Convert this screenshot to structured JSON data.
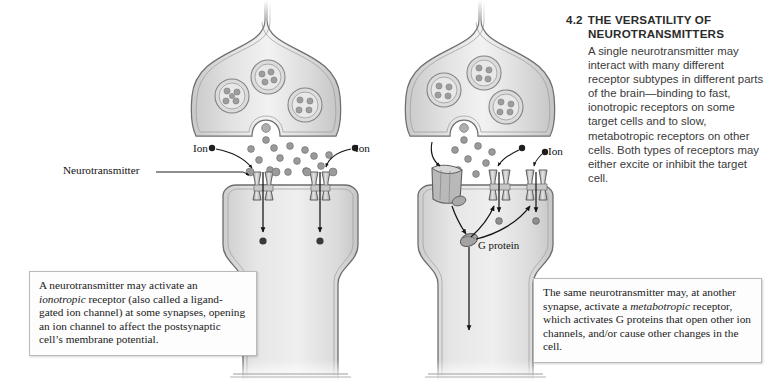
{
  "figure": {
    "number": "4.2",
    "title_line1": "THE VERSATILITY OF",
    "title_line2": "NEUROTRANSMITTERS",
    "body": "A single neurotransmitter may interact with many different receptor subtypes in different parts of the brain—binding to fast, ionotropic receptors on some target cells and to slow, metabotropic receptors on other cells. Both types of receptors may either excite or inhibit the target cell."
  },
  "captions": {
    "left": {
      "text_before": "A neurotransmitter may activate an ",
      "emphasis": "ionotropic",
      "text_after": " receptor (also called a ligand-gated ion channel) at some synapses, opening an ion channel to affect the postsynaptic cell’s membrane potential."
    },
    "right": {
      "text_before": "The same neurotransmitter may, at another synapse, activate a ",
      "emphasis": "metabotropic",
      "text_after": " receptor, which activates G proteins that open other ion channels, and/or cause other changes in the cell."
    }
  },
  "diagram": {
    "labels": {
      "neurotransmitter": "Neurotransmitter",
      "ion_left": "Ion",
      "ion_mid": "Ion",
      "ion_right": "Ion",
      "g_protein": "G protein"
    },
    "panels": [
      {
        "id": "ionotropic",
        "receptor_type": "ionotropic",
        "receptor_count": 2,
        "vesicle_count": 3,
        "transmitter_dot_count": 14
      },
      {
        "id": "metabotropic",
        "receptor_type": "metabotropic",
        "receptor_count": 1,
        "ion_channel_count": 2,
        "vesicle_count": 3,
        "transmitter_dot_count": 8,
        "g_protein_count": 1
      }
    ]
  },
  "colors": {
    "cell_fill_light": "#e7e7e7",
    "cell_fill_mid": "#d2d2d2",
    "cell_outline": "#6d6d6d",
    "dot_fill": "#8e8e8e",
    "ion_dot_fill": "#3a3a3a",
    "arrow": "#1a1a1a",
    "caption_border": "#b9b9b9",
    "title_text": "#2b2b2b",
    "body_text": "#3a3a3a",
    "page_background": "#ffffff"
  }
}
